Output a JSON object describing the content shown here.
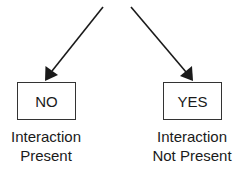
{
  "diagram": {
    "type": "decision-branch",
    "branches": [
      {
        "box_label": "NO",
        "caption_line1": "Interaction",
        "caption_line2": "Present"
      },
      {
        "box_label": "YES",
        "caption_line1": "Interaction",
        "caption_line2": "Not Present"
      }
    ],
    "colors": {
      "line": "#1a1a1a",
      "box_border": "#333333",
      "background": "#ffffff"
    }
  }
}
